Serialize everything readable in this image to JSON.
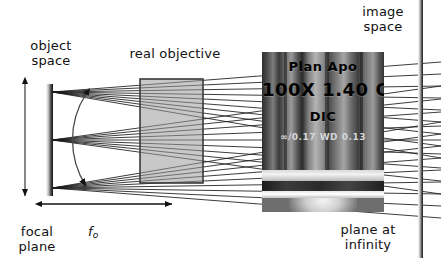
{
  "diagram": {
    "labels": {
      "object_space": "object\nspace",
      "real_objective": "real objective",
      "image_space": "image\nspace",
      "focal_plane": "focal\nplane",
      "focal_length_symbol": "f",
      "focal_length_subscript": "o",
      "plane_at_infinity": "plane at\ninfinity"
    },
    "objective_photo": {
      "line1": "Plan Apo",
      "line2": "100X  1.40 Oil",
      "line3": "DIC",
      "line4": "∞/0.17   WD 0.13"
    },
    "colors": {
      "background": "#ffffff",
      "objective_fill": "#9b9b9b",
      "objective_border": "#3a3a3a",
      "ray": "#1a1a1a",
      "arrow": "#111111",
      "text": "#111111"
    },
    "geometry": {
      "objective_box": {
        "x": 140,
        "y": 79,
        "w": 63,
        "h": 104
      },
      "object_plane_x": 49,
      "image_plane_x": 420,
      "axis_y": 140,
      "fan_origins_y": [
        92,
        140,
        188
      ],
      "rays_per_fan": 9,
      "focal_arrow": {
        "x1": 42,
        "x2": 172,
        "y": 204
      }
    }
  }
}
